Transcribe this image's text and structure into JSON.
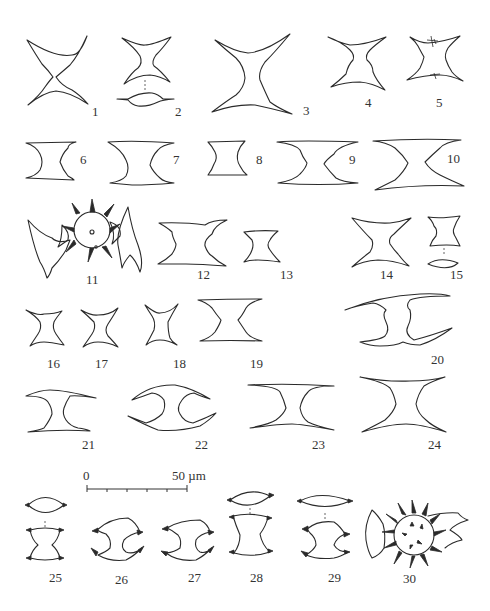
{
  "plate": {
    "description": "Plate of desmid cell outline drawings (front views, some with apical views), numbered figures 1-30",
    "background": "#ffffff",
    "line_color": "#2a2a2a"
  },
  "figures": [
    {
      "id": 1,
      "label": "1"
    },
    {
      "id": 2,
      "label": "2"
    },
    {
      "id": 3,
      "label": "3"
    },
    {
      "id": 4,
      "label": "4"
    },
    {
      "id": 5,
      "label": "5"
    },
    {
      "id": 6,
      "label": "6"
    },
    {
      "id": 7,
      "label": "7"
    },
    {
      "id": 8,
      "label": "8"
    },
    {
      "id": 9,
      "label": "9"
    },
    {
      "id": 10,
      "label": "10"
    },
    {
      "id": 11,
      "label": "11"
    },
    {
      "id": 12,
      "label": "12"
    },
    {
      "id": 13,
      "label": "13"
    },
    {
      "id": 14,
      "label": "14"
    },
    {
      "id": 15,
      "label": "15"
    },
    {
      "id": 16,
      "label": "16"
    },
    {
      "id": 17,
      "label": "17"
    },
    {
      "id": 18,
      "label": "18"
    },
    {
      "id": 19,
      "label": "19"
    },
    {
      "id": 20,
      "label": "20"
    },
    {
      "id": 21,
      "label": "21"
    },
    {
      "id": 22,
      "label": "22"
    },
    {
      "id": 23,
      "label": "23"
    },
    {
      "id": 24,
      "label": "24"
    },
    {
      "id": 25,
      "label": "25"
    },
    {
      "id": 26,
      "label": "26"
    },
    {
      "id": 27,
      "label": "27"
    },
    {
      "id": 28,
      "label": "28"
    },
    {
      "id": 29,
      "label": "29"
    },
    {
      "id": 30,
      "label": "30"
    }
  ],
  "scale_bar": {
    "start_label": "0",
    "end_label": "50 µm",
    "ticks": 6
  }
}
